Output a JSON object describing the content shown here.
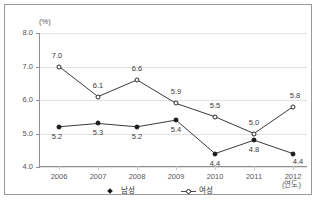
{
  "axis": {
    "unit_label": "(%)",
    "x_title": "(연도)"
  },
  "legend": [
    {
      "label": "남성",
      "marker": "filled-diamond-icon"
    },
    {
      "label": "여성",
      "marker": "open-circle-icon"
    }
  ],
  "chart_data": {
    "type": "line",
    "title": "",
    "xlabel": "(연도)",
    "ylabel": "(%)",
    "ylim": [
      4.0,
      8.0
    ],
    "ytick_labels": [
      "4.0",
      "5.0",
      "6.0",
      "7.0",
      "8.0"
    ],
    "yticks": [
      4.0,
      5.0,
      6.0,
      7.0,
      8.0
    ],
    "grid": true,
    "legend_position": "bottom",
    "categories": [
      "2006",
      "2007",
      "2008",
      "2009",
      "2010",
      "2011",
      "2012"
    ],
    "series": [
      {
        "name": "남성",
        "marker": "filled-circle",
        "values": [
          5.2,
          5.3,
          5.2,
          5.4,
          4.4,
          4.8,
          4.4
        ],
        "labels": [
          "5.2",
          "5.3",
          "5.2",
          "5.4",
          "4.4",
          "4.8",
          "4.4"
        ]
      },
      {
        "name": "여성",
        "marker": "open-circle",
        "values": [
          7.0,
          6.1,
          6.6,
          5.9,
          5.5,
          5.0,
          5.8
        ],
        "labels": [
          "7.0",
          "6.1",
          "6.6",
          "5.9",
          "5.5",
          "5.0",
          "5.8"
        ]
      }
    ]
  }
}
